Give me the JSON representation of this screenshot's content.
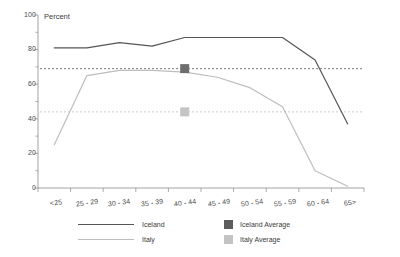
{
  "chart_data": {
    "type": "line",
    "title": "",
    "subtitle": "",
    "xlabel": "",
    "ylabel": "Percent",
    "ylim": [
      0,
      100
    ],
    "yticks": [
      0,
      20,
      40,
      60,
      80,
      100
    ],
    "yminor_ticks": [
      10,
      30,
      50,
      70,
      90
    ],
    "grid": false,
    "legend_position": "bottom",
    "categories": [
      "<25",
      "25 - 29",
      "30 - 34",
      "35 - 39",
      "40 - 44",
      "45 - 49",
      "50 - 54",
      "55 - 59",
      "60 - 64",
      "65>"
    ],
    "series": [
      {
        "name": "Iceland",
        "color": "#555555",
        "style": "solid",
        "values": [
          81,
          81,
          84,
          82,
          87,
          87,
          87,
          87,
          74,
          37
        ]
      },
      {
        "name": "Italy",
        "color": "#bdbdbd",
        "style": "solid",
        "values": [
          25,
          65,
          68,
          68,
          67,
          64,
          58,
          47,
          10,
          1
        ]
      }
    ],
    "reference_lines": [
      {
        "name": "Iceland Average",
        "value": 69,
        "color": "#6e6e6e",
        "style": "dotted",
        "marker": "square",
        "marker_category": "40 - 44"
      },
      {
        "name": "Italy Average",
        "value": 44,
        "color": "#c4c4c4",
        "style": "dotted",
        "marker": "square",
        "marker_category": "40 - 44"
      }
    ]
  },
  "axis": {
    "y_title": "Percent",
    "y_tick_labels": [
      "0",
      "20",
      "40",
      "60",
      "80",
      "100"
    ],
    "x_tick_labels": [
      "<25",
      "25 - 29",
      "30 - 34",
      "35 - 39",
      "40 - 44",
      "45 - 49",
      "50 - 54",
      "55 - 59",
      "60 - 64",
      "65>"
    ]
  },
  "legend": {
    "items": [
      {
        "label": "Iceland",
        "kind": "line",
        "color": "#555555"
      },
      {
        "label": "Italy",
        "kind": "line",
        "color": "#bdbdbd"
      },
      {
        "label": "Iceland Average",
        "kind": "swatch",
        "color": "#5c5c5c"
      },
      {
        "label": "Italy Average",
        "kind": "swatch",
        "color": "#c4c4c4"
      }
    ]
  },
  "colors": {
    "iceland": "#555555",
    "italy": "#bdbdbd",
    "iceland_average": "#5c5c5c",
    "italy_average": "#c4c4c4",
    "axis": "#8a8a8a",
    "text": "#3c3c3c",
    "background": "#ffffff"
  }
}
